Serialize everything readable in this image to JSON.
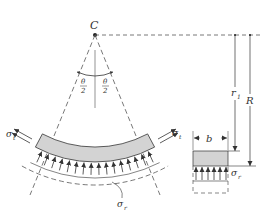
{
  "figure": {
    "center_label": "C",
    "angle_half_left": {
      "num": "θ",
      "den": "2"
    },
    "angle_half_right": {
      "num": "θ",
      "den": "2"
    },
    "inner_radius_label": "r",
    "inner_radius_sub": "1",
    "outer_radius_label": "R",
    "width_label": "b",
    "hoop_stress_left": {
      "sym": "σ",
      "sub": "t"
    },
    "hoop_stress_right": {
      "sym": "σ",
      "sub": "t"
    },
    "radial_stress_bottom": {
      "sym": "σ",
      "sub": "r"
    },
    "radial_stress_section": {
      "sym": "σ",
      "sub": "r"
    }
  },
  "colors": {
    "line": "#333333",
    "shade": "#d3d3d3",
    "dash": "#555555"
  }
}
